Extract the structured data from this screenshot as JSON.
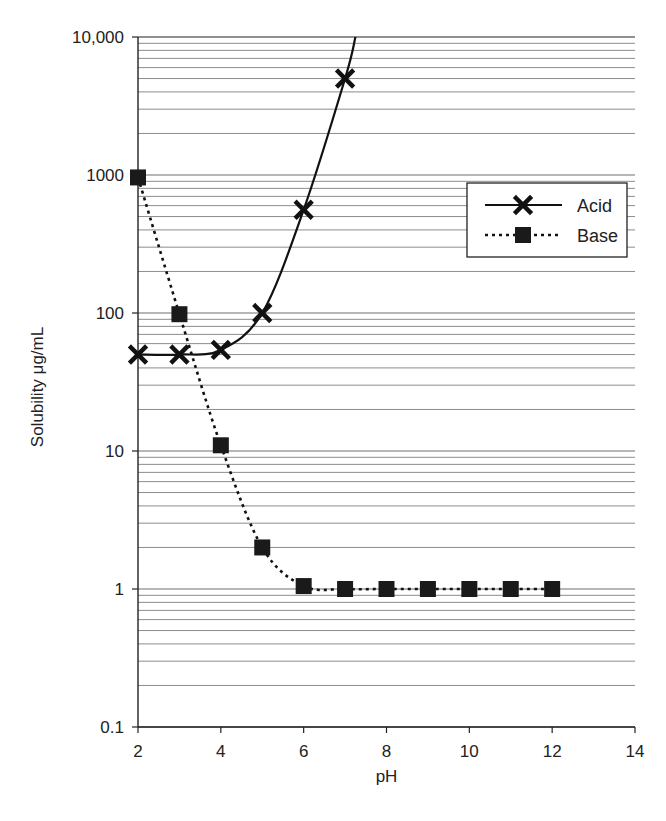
{
  "chart_data": {
    "type": "line",
    "title": "",
    "xlabel": "pH",
    "ylabel": "Solubility μg/mL",
    "xlim": [
      2,
      14
    ],
    "ylim": [
      0.1,
      10000
    ],
    "yscale": "log",
    "x_ticks": [
      2,
      4,
      6,
      8,
      10,
      12,
      14
    ],
    "x_tick_labels": [
      "2",
      "4",
      "6",
      "8",
      "10",
      "12",
      "14"
    ],
    "y_ticks": [
      0.1,
      1,
      10,
      100,
      1000,
      10000
    ],
    "y_tick_labels": [
      "0.1",
      "1",
      "10",
      "100",
      "1000",
      "10,000"
    ],
    "grid": {
      "horizontal": true,
      "vertical": false,
      "minor_log": true
    },
    "legend_position": "upper right (inside)",
    "series": [
      {
        "name": "Acid",
        "marker": "x",
        "line_style": "solid",
        "x": [
          2,
          3,
          4,
          5,
          6,
          7
        ],
        "values": [
          50,
          50,
          54,
          100,
          560,
          5000
        ],
        "curve_extends_to": {
          "x": 7.25,
          "y": 10000
        }
      },
      {
        "name": "Base",
        "marker": "square",
        "line_style": "dotted",
        "x": [
          2,
          3,
          4,
          5,
          6,
          7,
          8,
          9,
          10,
          11,
          12
        ],
        "values": [
          960,
          98,
          11,
          2,
          1.05,
          1,
          1,
          1,
          1,
          1,
          1
        ]
      }
    ]
  },
  "colors": {
    "line": "#111111",
    "grid": "#6e6e6e",
    "axis": "#222222",
    "background": "#ffffff"
  },
  "layout": {
    "plot_left": 138,
    "plot_right": 635,
    "plot_top": 37,
    "plot_bottom": 727
  }
}
